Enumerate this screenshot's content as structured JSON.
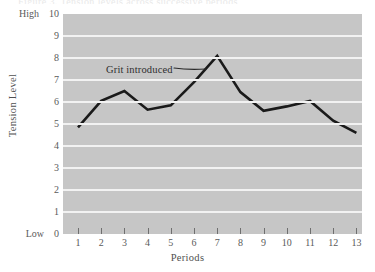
{
  "page": {
    "top_crop_remnant": "Figure 3.  Tension levels across successive periods"
  },
  "chart_data": {
    "type": "line",
    "title": "",
    "xlabel": "Periods",
    "ylabel": "Tension Level",
    "categories": [
      "1",
      "2",
      "3",
      "4",
      "5",
      "6",
      "7",
      "8",
      "9",
      "10",
      "11",
      "12",
      "13"
    ],
    "x": [
      1,
      2,
      3,
      4,
      5,
      6,
      7,
      8,
      9,
      10,
      11,
      12,
      13
    ],
    "values": [
      4.85,
      6.05,
      6.5,
      5.65,
      5.85,
      6.9,
      8.1,
      6.45,
      5.6,
      5.8,
      6.05,
      5.15,
      4.6
    ],
    "series": [
      {
        "name": "Tension Level",
        "values": [
          4.85,
          6.05,
          6.5,
          5.65,
          5.85,
          6.9,
          8.1,
          6.45,
          5.6,
          5.8,
          6.05,
          5.15,
          4.6
        ]
      }
    ],
    "ylim": [
      0,
      10
    ],
    "xlim": [
      1,
      13
    ],
    "ytick_labels": [
      "10",
      "9",
      "8",
      "7",
      "6",
      "5",
      "4",
      "3",
      "2",
      "1",
      "0"
    ],
    "ytick_values": [
      10,
      9,
      8,
      7,
      6,
      5,
      4,
      3,
      2,
      1,
      0
    ],
    "y_axis_high_label": "High",
    "y_axis_low_label": "Low",
    "xtick_labels": [
      "1",
      "2",
      "3",
      "4",
      "5",
      "6",
      "7",
      "8",
      "9",
      "10",
      "11",
      "12",
      "13"
    ],
    "grid": true,
    "grid_orientation": "horizontal",
    "legend": "none",
    "annotations": [
      {
        "text": "Grit introduced",
        "points_to_x": 6.5,
        "points_to_y": 7.5
      }
    ],
    "colors": {
      "plot_background": "#c6c6c6",
      "gridline": "#f2f2f2",
      "line": "#1a1a1a",
      "text": "#5a5a5a",
      "page_background": "#ffffff"
    }
  }
}
